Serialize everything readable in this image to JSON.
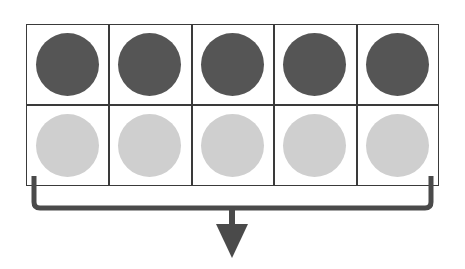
{
  "diagram": {
    "type": "ten-frame",
    "rows": 2,
    "columns": 5,
    "cells": [
      {
        "row": 0,
        "col": 0,
        "counter": "dark"
      },
      {
        "row": 0,
        "col": 1,
        "counter": "dark"
      },
      {
        "row": 0,
        "col": 2,
        "counter": "dark"
      },
      {
        "row": 0,
        "col": 3,
        "counter": "dark"
      },
      {
        "row": 0,
        "col": 4,
        "counter": "dark"
      },
      {
        "row": 1,
        "col": 0,
        "counter": "light"
      },
      {
        "row": 1,
        "col": 1,
        "counter": "light"
      },
      {
        "row": 1,
        "col": 2,
        "counter": "light"
      },
      {
        "row": 1,
        "col": 3,
        "counter": "light"
      },
      {
        "row": 1,
        "col": 4,
        "counter": "light"
      }
    ],
    "colors": {
      "dark_counter": "#555555",
      "light_counter": "#cfcfcf",
      "grid_line": "#3a3a3a",
      "bracket_arrow": "#4a4a4a"
    },
    "bracket": {
      "spans": "all 10 cells",
      "direction": "down"
    }
  }
}
